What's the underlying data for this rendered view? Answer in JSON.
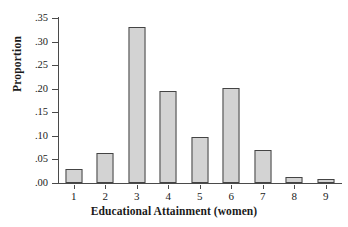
{
  "chart_data": {
    "type": "bar",
    "title": "",
    "xlabel": "Educational Attainment (women)",
    "ylabel": "Proportion",
    "categories": [
      "1",
      "2",
      "3",
      "4",
      "5",
      "6",
      "7",
      "8",
      "9"
    ],
    "values": [
      0.03,
      0.063,
      0.33,
      0.195,
      0.098,
      0.201,
      0.07,
      0.012,
      0.008
    ],
    "ylim": [
      0.0,
      0.35
    ],
    "ytick_values": [
      0.0,
      0.05,
      0.1,
      0.15,
      0.2,
      0.25,
      0.3,
      0.35
    ],
    "ytick_labels": [
      ".00",
      ".05",
      ".10",
      ".15",
      ".20",
      ".25",
      ".30",
      ".35"
    ],
    "grid": false,
    "legend": false,
    "legend_position": "none",
    "series": [
      {
        "name": "Proportion",
        "values": [
          0.03,
          0.063,
          0.33,
          0.195,
          0.098,
          0.201,
          0.07,
          0.012,
          0.008
        ]
      }
    ],
    "colors": {
      "bar_fill": "#d3d3d3",
      "bar_border": "#444444",
      "axis": "#4a4a4a",
      "text": "#1a1a1a",
      "background": "#ffffff"
    }
  }
}
